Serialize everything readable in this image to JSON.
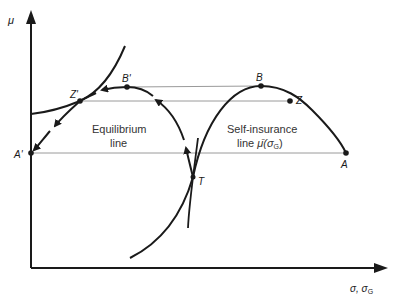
{
  "diagram": {
    "y_axis_label": "μ",
    "x_axis_label": "σ, σ",
    "x_axis_label_sub": "G",
    "points": {
      "A": "A",
      "A_prime": "A'",
      "B": "B",
      "B_prime": "B'",
      "Z": "Z",
      "Z_prime": "Z'",
      "T": "T"
    },
    "labels": {
      "equilibrium_line_1": "Equilibrium",
      "equilibrium_line_2": "line",
      "self_insurance_1": "Self-insurance",
      "self_insurance_2": "line ",
      "self_insurance_mu": "μ̄",
      "self_insurance_open": "(σ",
      "self_insurance_sub": "G",
      "self_insurance_close": ")"
    },
    "colors": {
      "ink": "#1a1a1a",
      "guide": "#9a9a9a"
    }
  }
}
